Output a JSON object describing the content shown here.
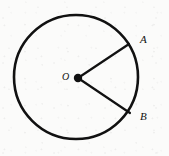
{
  "figure": {
    "background_color": "#fbfbfa",
    "ink_color": "#111111",
    "labels": {
      "center": "O",
      "point_a": "A",
      "point_b": "B"
    },
    "geometry": {
      "circle": {
        "cx": 76,
        "cy": 77,
        "r": 62,
        "stroke_width": 2.6
      },
      "center_dot": {
        "cx": 78,
        "cy": 78,
        "r": 4.2
      },
      "radius_oa": {
        "x1": 78,
        "y1": 78,
        "x2": 129,
        "y2": 44,
        "stroke_width": 2.2
      },
      "radius_ob": {
        "x1": 78,
        "y1": 78,
        "x2": 130,
        "y2": 113,
        "stroke_width": 2.2
      }
    }
  }
}
